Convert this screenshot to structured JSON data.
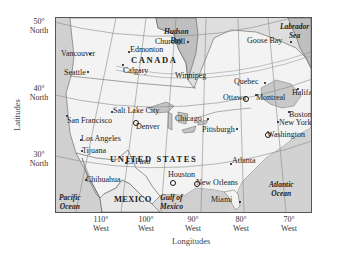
{
  "map": {
    "axis": {
      "y_title": "Latitudes",
      "x_title": "Longitudes",
      "latitudes": [
        {
          "deg": "50°",
          "dir": "North"
        },
        {
          "deg": "40°",
          "dir": "North"
        },
        {
          "deg": "30°",
          "dir": "North"
        }
      ],
      "longitudes": [
        {
          "deg": "110°",
          "dir": "West"
        },
        {
          "deg": "100°",
          "dir": "West"
        },
        {
          "deg": "90°",
          "dir": "West"
        },
        {
          "deg": "80°",
          "dir": "West"
        },
        {
          "deg": "70°",
          "dir": "West"
        }
      ]
    },
    "countries": {
      "canada": "CANADA",
      "united_states": "UNITED STATES",
      "mexico": "MEXICO"
    },
    "water_bodies": {
      "hudson_bay": [
        "Hudson",
        "Bay"
      ],
      "labrador_sea": [
        "Labrador",
        "Sea"
      ],
      "atlantic_ocean": [
        "Atlantic",
        "Ocean"
      ],
      "pacific_ocean": [
        "Pacific",
        "Ocean"
      ],
      "gulf_of_mexico": [
        "Gulf of",
        "Mexico"
      ]
    },
    "cities": {
      "churchill": "Churchill",
      "edmonton": "Edmonton",
      "vancouver": "Vancouver",
      "seattle": "Seattle",
      "calgary": "Calgary",
      "winnipeg": "Winnipeg",
      "goose_bay": "Goose Bay",
      "quebec": "Quebec",
      "ottawa": "Ottawa",
      "montreal": "Montreal",
      "halifax": "Halifax",
      "boston": "Boston",
      "new_york": "New York",
      "washington": "Washington",
      "salt_lake_city": "Salt Lake City",
      "san_francisco": "San Francisco",
      "denver": "Denver",
      "chicago": "Chicago",
      "pittsburgh": "Pittsburgh",
      "los_angeles": "Los Angeles",
      "tijuana": "Tijuana",
      "el_paso": "El Paso",
      "atlanta": "Atlanta",
      "houston": "Houston",
      "new_orleans": "New Orleans",
      "chihuahua": "Chihuahua",
      "miami": "Miami"
    },
    "colors": {
      "land": "#f4f4f4",
      "water": "#bdbdbd",
      "other_land": "#dcdcdc",
      "grid": "#8a8a8a",
      "border": "#555555"
    }
  }
}
